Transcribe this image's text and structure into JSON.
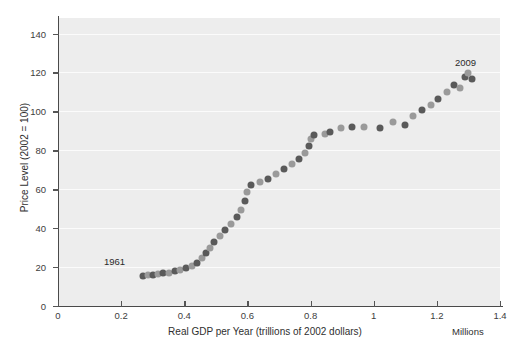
{
  "chart_data": {
    "type": "scatter",
    "title": "",
    "xlabel": "Real GDP per Year (trillions of 2002 dollars)",
    "ylabel": "Price Level (2002 = 100)",
    "x_units_label": "Millions",
    "xlim": [
      0,
      1.4
    ],
    "ylim": [
      0,
      148
    ],
    "xticks": [
      "0",
      "0.2",
      "0.4",
      "0.6",
      "0.8",
      "1",
      "1.2",
      "1.4"
    ],
    "xtick_values": [
      0,
      0.2,
      0.4,
      0.6,
      0.8,
      1.0,
      1.2,
      1.4
    ],
    "yticks": [
      "0",
      "20",
      "40",
      "60",
      "80",
      "100",
      "120",
      "140"
    ],
    "ytick_values": [
      0,
      20,
      40,
      60,
      80,
      100,
      120,
      140
    ],
    "grid": "horizontal",
    "legend": "none",
    "series_name": "Aggregate supply / price level vs real GDP",
    "marker_colors": [
      "#5a5a5a",
      "#9a9a9a"
    ],
    "background_color": "#ededed",
    "gridline_color": "#fbfbfb",
    "annotations": [
      {
        "label": "1961",
        "x": 0.27,
        "y": 16
      },
      {
        "label": "2009",
        "x": 1.3,
        "y": 121
      }
    ],
    "points": [
      {
        "x": 0.268,
        "y": 15.5
      },
      {
        "x": 0.285,
        "y": 15.8
      },
      {
        "x": 0.302,
        "y": 16.1
      },
      {
        "x": 0.318,
        "y": 16.4
      },
      {
        "x": 0.334,
        "y": 16.8
      },
      {
        "x": 0.352,
        "y": 17.2
      },
      {
        "x": 0.37,
        "y": 17.8
      },
      {
        "x": 0.388,
        "y": 18.6
      },
      {
        "x": 0.405,
        "y": 19.5
      },
      {
        "x": 0.423,
        "y": 20.6
      },
      {
        "x": 0.44,
        "y": 22.2
      },
      {
        "x": 0.455,
        "y": 24.5
      },
      {
        "x": 0.468,
        "y": 27.0
      },
      {
        "x": 0.48,
        "y": 29.8
      },
      {
        "x": 0.495,
        "y": 32.8
      },
      {
        "x": 0.512,
        "y": 35.8
      },
      {
        "x": 0.53,
        "y": 38.8
      },
      {
        "x": 0.548,
        "y": 42.0
      },
      {
        "x": 0.566,
        "y": 45.5
      },
      {
        "x": 0.58,
        "y": 49.5
      },
      {
        "x": 0.592,
        "y": 54.0
      },
      {
        "x": 0.6,
        "y": 58.5
      },
      {
        "x": 0.612,
        "y": 62.0
      },
      {
        "x": 0.64,
        "y": 63.5
      },
      {
        "x": 0.665,
        "y": 65.5
      },
      {
        "x": 0.69,
        "y": 68.0
      },
      {
        "x": 0.715,
        "y": 70.5
      },
      {
        "x": 0.74,
        "y": 73.0
      },
      {
        "x": 0.762,
        "y": 75.5
      },
      {
        "x": 0.782,
        "y": 78.5
      },
      {
        "x": 0.795,
        "y": 82.0
      },
      {
        "x": 0.802,
        "y": 86.0
      },
      {
        "x": 0.812,
        "y": 88.0
      },
      {
        "x": 0.845,
        "y": 88.5
      },
      {
        "x": 0.862,
        "y": 89.5
      },
      {
        "x": 0.895,
        "y": 91.5
      },
      {
        "x": 0.93,
        "y": 92.0
      },
      {
        "x": 0.968,
        "y": 92.0
      },
      {
        "x": 1.02,
        "y": 91.5
      },
      {
        "x": 1.062,
        "y": 94.5
      },
      {
        "x": 1.098,
        "y": 93.0
      },
      {
        "x": 1.125,
        "y": 97.5
      },
      {
        "x": 1.152,
        "y": 100.5
      },
      {
        "x": 1.18,
        "y": 103.5
      },
      {
        "x": 1.205,
        "y": 106.5
      },
      {
        "x": 1.232,
        "y": 110.0
      },
      {
        "x": 1.255,
        "y": 113.5
      },
      {
        "x": 1.272,
        "y": 112.0
      },
      {
        "x": 1.288,
        "y": 117.5
      },
      {
        "x": 1.3,
        "y": 119.5
      },
      {
        "x": 1.312,
        "y": 116.5
      }
    ]
  }
}
